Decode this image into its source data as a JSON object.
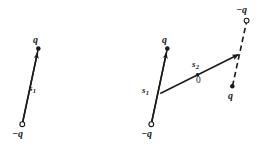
{
  "figure": {
    "type": "vector-diagram",
    "background_color": "#ffffff",
    "ink_color": "#1a1a1a",
    "width": 267,
    "height": 149,
    "panels": [
      {
        "name": "left-panel",
        "description": "single dipole with displacement vector s1",
        "elements": {
          "negative_charge_label": "−q",
          "positive_charge_label": "q",
          "vector_label": "s",
          "vector_subscript": "1"
        }
      },
      {
        "name": "right-panel",
        "description": "two dipoles, original with s1 and displaced copy with s2 from origin",
        "elements": {
          "negative_charge_label_bottom": "−q",
          "positive_charge_label_bottom": "q",
          "negative_charge_label_top": "−q",
          "positive_charge_label_top": "q",
          "vector_label_1": "s",
          "vector_subscript_1": "1",
          "vector_label_2": "s",
          "vector_subscript_2": "2",
          "origin_label": "0"
        }
      }
    ]
  },
  "labels": {
    "left_q": "q",
    "left_neg_q": "−q",
    "left_s": "s",
    "left_s_sub": "1",
    "right_q_lower": "q",
    "right_neg_q_lower": "−q",
    "right_s1": "s",
    "right_s1_sub": "1",
    "right_s2": "s",
    "right_s2_sub": "2",
    "right_origin": "0",
    "right_neg_q_upper": "−q",
    "right_q_upper": "q"
  }
}
